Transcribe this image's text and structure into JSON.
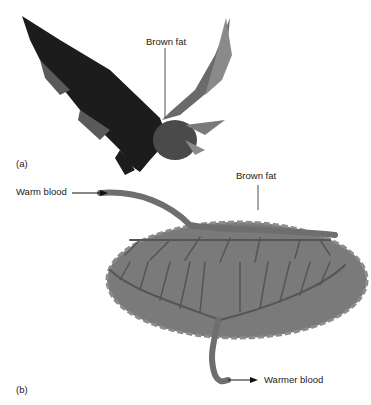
{
  "panel_a": {
    "label": "(a)",
    "subject": "bat",
    "callout": "Brown fat"
  },
  "panel_b": {
    "label": "(b)",
    "callout": "Brown fat",
    "inflow": "Warm blood",
    "outflow": "Warmer blood"
  },
  "colors": {
    "fat": "#7a7a7a",
    "vessel": "#5a5a5a",
    "bat_dark": "#1c1c1c",
    "bat_mid": "#555555"
  }
}
